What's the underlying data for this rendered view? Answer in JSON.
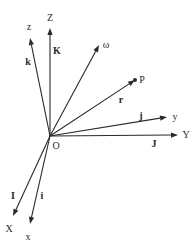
{
  "diagram": {
    "origin": {
      "label": "O",
      "x": 50,
      "y": 136,
      "label_x": 56,
      "label_y": 149
    },
    "vectors": [
      {
        "id": "Z-axis",
        "label": "Z",
        "x2": 50,
        "y2": 28,
        "label_x": 50,
        "label_y": 21,
        "unit": "K",
        "unit_x": 57,
        "unit_y": 54,
        "unit_bold": true
      },
      {
        "id": "z-axis",
        "label": "z",
        "x2": 30,
        "y2": 38,
        "label_x": 29,
        "label_y": 30,
        "unit": "k",
        "unit_x": 28,
        "unit_y": 65,
        "unit_bold": true
      },
      {
        "id": "omega-vector",
        "label": "ω",
        "x2": 99,
        "y2": 45,
        "label_x": 106,
        "label_y": 48,
        "unit": "",
        "unit_x": 0,
        "unit_y": 0,
        "unit_bold": false
      },
      {
        "id": "r-vector",
        "label": "P",
        "x2": 135,
        "y2": 80,
        "label_x": 142,
        "label_y": 83,
        "unit": "r",
        "unit_x": 121,
        "unit_y": 103,
        "unit_bold": true
      },
      {
        "id": "y-axis",
        "label": "y",
        "x2": 167,
        "y2": 117,
        "label_x": 175,
        "label_y": 120,
        "unit": "j",
        "unit_x": 141,
        "unit_y": 119,
        "unit_bold": true
      },
      {
        "id": "Y-axis",
        "label": "Y",
        "x2": 178,
        "y2": 135,
        "label_x": 186,
        "label_y": 138,
        "unit": "J",
        "unit_x": 154,
        "unit_y": 147,
        "unit_bold": true
      },
      {
        "id": "X-axis",
        "label": "X",
        "x2": 13,
        "y2": 216,
        "label_x": 9,
        "label_y": 232,
        "unit": "I",
        "unit_x": 13,
        "unit_y": 199,
        "unit_bold": true
      },
      {
        "id": "x-axis",
        "label": "x",
        "x2": 30,
        "y2": 224,
        "label_x": 28,
        "label_y": 240,
        "unit": "i",
        "unit_x": 42,
        "unit_y": 199,
        "unit_bold": true
      }
    ],
    "point": {
      "label": "P",
      "x": 135,
      "y": 80
    },
    "colors": {
      "stroke": "#2a2a2a",
      "background": "#ffffff"
    }
  }
}
